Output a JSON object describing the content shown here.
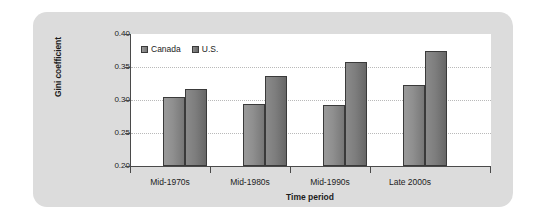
{
  "chart_data": {
    "type": "bar",
    "title": "",
    "xlabel": "Time period",
    "ylabel": "Gini coefficient",
    "categories": [
      "Mid-1970s",
      "Mid-1980s",
      "Mid-1990s",
      "Late 2000s"
    ],
    "series": [
      {
        "name": "Canada",
        "values": [
          0.305,
          0.294,
          0.292,
          0.323
        ],
        "color": "#8f8f8f"
      },
      {
        "name": "U.S.",
        "values": [
          0.316,
          0.336,
          0.358,
          0.374
        ],
        "color": "#7e7e7e"
      }
    ],
    "ylim": [
      0.2,
      0.4
    ],
    "yticks": [
      "0.40",
      "0.35",
      "0.30",
      "0.25",
      "0.20"
    ],
    "ytick_values": [
      0.4,
      0.35,
      0.3,
      0.25,
      0.2
    ],
    "grid": true,
    "legend_position": "top-left"
  },
  "legend": {
    "entries": [
      {
        "label": "Canada"
      },
      {
        "label": "U.S."
      }
    ]
  },
  "colors": {
    "card_background": "#dcdcdc",
    "plot_background": "#ffffff",
    "axis": "#4a4a4a",
    "gridline": "#b9b9b9",
    "text": "#1c1c1c"
  }
}
